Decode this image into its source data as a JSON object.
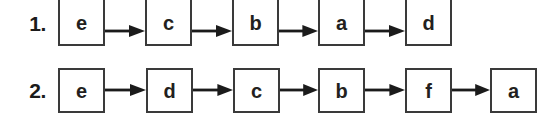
{
  "figure": {
    "background_color": "#ffffff",
    "box_border_color": "#3a3a3a",
    "text_color": "#231f20",
    "arrow_color": "#1b1b1b",
    "arrow_icon_name": "arrow-right-icon"
  },
  "rows": [
    {
      "index_label": "1.",
      "nodes": [
        "e",
        "c",
        "b",
        "a",
        "d"
      ],
      "node_count": 5,
      "arrow_count": 4
    },
    {
      "index_label": "2.",
      "nodes": [
        "e",
        "d",
        "c",
        "b",
        "f",
        "a"
      ],
      "node_count": 6,
      "arrow_count": 5
    }
  ]
}
